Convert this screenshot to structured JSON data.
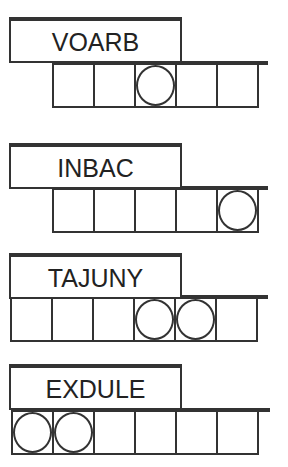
{
  "puzzles": [
    {
      "scrambled": "VOARB",
      "letter_count": 5,
      "answer_cells": [
        "",
        "",
        "",
        "",
        ""
      ],
      "circled_positions": [
        3
      ]
    },
    {
      "scrambled": "INBAC",
      "letter_count": 5,
      "answer_cells": [
        "",
        "",
        "",
        "",
        ""
      ],
      "circled_positions": [
        5
      ]
    },
    {
      "scrambled": "TAJUNY",
      "letter_count": 6,
      "answer_cells": [
        "",
        "",
        "",
        "",
        "",
        ""
      ],
      "circled_positions": [
        4,
        5
      ]
    },
    {
      "scrambled": "EXDULE",
      "letter_count": 6,
      "answer_cells": [
        "",
        "",
        "",
        "",
        "",
        ""
      ],
      "circled_positions": [
        1,
        2
      ]
    }
  ],
  "colors": {
    "line": "#333333",
    "background": "#ffffff",
    "text": "#222222"
  }
}
